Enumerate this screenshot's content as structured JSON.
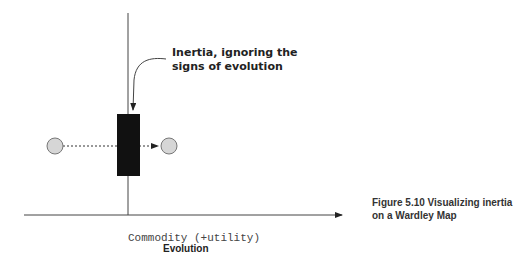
{
  "figure": {
    "annotation": "Inertia, ignoring the signs of evolution",
    "x_tick_label": "Commodity (+utility)",
    "x_axis_label": "Evolution",
    "caption": "Figure 5.10    Visualizing inertia on a Wardley Map"
  },
  "elements": {
    "component_start": "circle",
    "component_end": "circle",
    "inertia_block": "black rectangle",
    "movement": "dashed arrow left to right"
  }
}
